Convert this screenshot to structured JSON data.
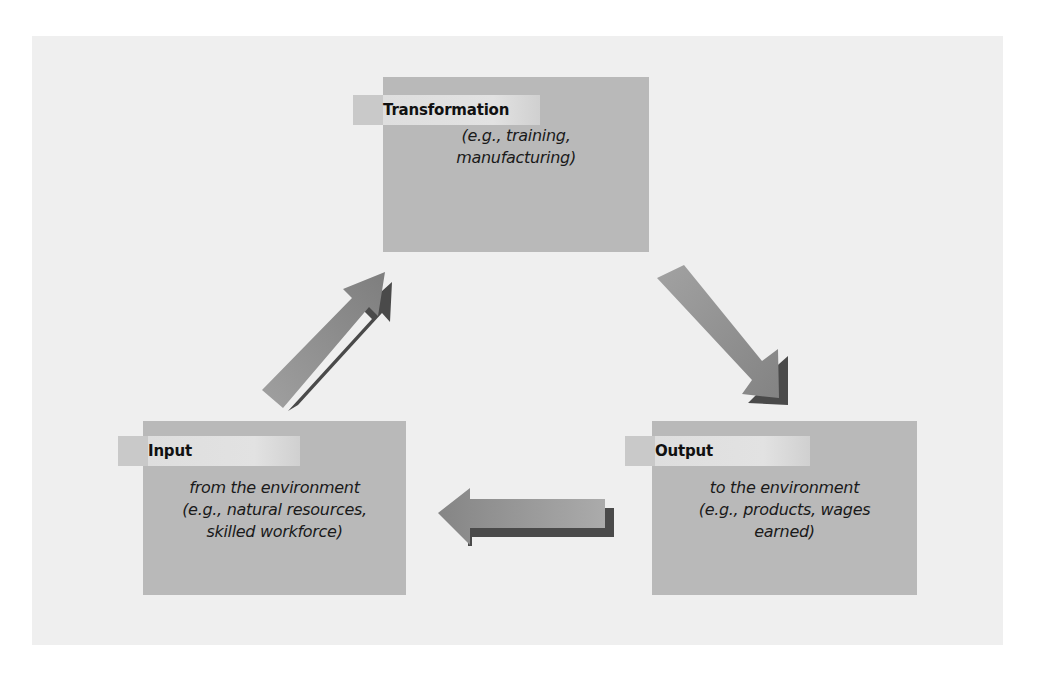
{
  "diagram": {
    "type": "cycle",
    "colors": {
      "panel_background": "#efefef",
      "box_fill": "#b9b9b9",
      "tab_fill": "#dedede",
      "tab_left_segment": "#c9c9c9",
      "arrow_fill": "#8e8e8e",
      "arrow_shadow": "#4a4a4a"
    },
    "nodes": [
      {
        "id": "transformation",
        "title": "Transformation",
        "lines": [
          "(e.g., training,",
          "manufacturing)"
        ]
      },
      {
        "id": "output",
        "title": "Output",
        "lines": [
          "to the environment",
          "(e.g., products, wages",
          "earned)"
        ]
      },
      {
        "id": "input",
        "title": "Input",
        "lines": [
          "from the environment",
          "(e.g., natural resources,",
          "skilled workforce)"
        ]
      }
    ],
    "edges": [
      {
        "from": "input",
        "to": "transformation",
        "icon": "arrow-up-right-icon"
      },
      {
        "from": "transformation",
        "to": "output",
        "icon": "arrow-down-right-icon"
      },
      {
        "from": "output",
        "to": "input",
        "icon": "arrow-left-icon"
      }
    ]
  }
}
